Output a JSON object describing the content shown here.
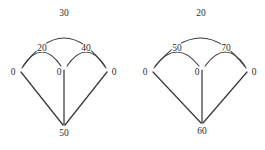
{
  "figure": {
    "title": "",
    "background_color": "#ffffff",
    "stroke_color": "#3a3a3a",
    "text_color": "#2e2e2e"
  },
  "diagrams": [
    {
      "id": "left-graph",
      "nodes": [
        {
          "id": "L-left",
          "label": "0",
          "x": 20,
          "y": 70
        },
        {
          "id": "L-middle",
          "label": "0",
          "x": 64,
          "y": 70
        },
        {
          "id": "L-right",
          "label": "0",
          "x": 108,
          "y": 70
        },
        {
          "id": "L-bottom",
          "label": "50",
          "x": 64,
          "y": 126
        }
      ],
      "edges": [
        {
          "id": "L-arc-outer",
          "kind": "arc",
          "from": "L-left",
          "to": "L-right",
          "label": "30",
          "label_x": 64,
          "label_y": 13
        },
        {
          "id": "L-arc-left",
          "kind": "arc",
          "from": "L-left",
          "to": "L-middle",
          "label": "20",
          "label_x": 42,
          "label_y": 48
        },
        {
          "id": "L-arc-right",
          "kind": "arc",
          "from": "L-middle",
          "to": "L-right",
          "label": "40",
          "label_x": 86,
          "label_y": 48
        },
        {
          "id": "L-line-left",
          "kind": "line",
          "from": "L-left",
          "to": "L-bottom",
          "label": ""
        },
        {
          "id": "L-line-mid",
          "kind": "line",
          "from": "L-middle",
          "to": "L-bottom",
          "label": ""
        },
        {
          "id": "L-line-right",
          "kind": "line",
          "from": "L-right",
          "to": "L-bottom",
          "label": ""
        }
      ]
    },
    {
      "id": "right-graph",
      "nodes": [
        {
          "id": "R-left",
          "label": "0",
          "x": 152,
          "y": 70
        },
        {
          "id": "R-middle",
          "label": "0",
          "x": 202,
          "y": 70
        },
        {
          "id": "R-right",
          "label": "0",
          "x": 248,
          "y": 70
        },
        {
          "id": "R-bottom",
          "label": "60",
          "x": 202,
          "y": 124
        }
      ],
      "edges": [
        {
          "id": "R-arc-outer",
          "kind": "arc",
          "from": "R-left",
          "to": "R-right",
          "label": "20",
          "label_x": 201,
          "label_y": 13
        },
        {
          "id": "R-arc-left",
          "kind": "arc",
          "from": "R-left",
          "to": "R-middle",
          "label": "50",
          "label_x": 177,
          "label_y": 48
        },
        {
          "id": "R-arc-right",
          "kind": "arc",
          "from": "R-middle",
          "to": "R-right",
          "label": "70",
          "label_x": 226,
          "label_y": 48
        },
        {
          "id": "R-line-left",
          "kind": "line",
          "from": "R-left",
          "to": "R-bottom",
          "label": ""
        },
        {
          "id": "R-line-mid",
          "kind": "line",
          "from": "R-middle",
          "to": "R-bottom",
          "label": ""
        },
        {
          "id": "R-line-right",
          "kind": "line",
          "from": "R-right",
          "to": "R-bottom",
          "label": ""
        }
      ]
    }
  ]
}
